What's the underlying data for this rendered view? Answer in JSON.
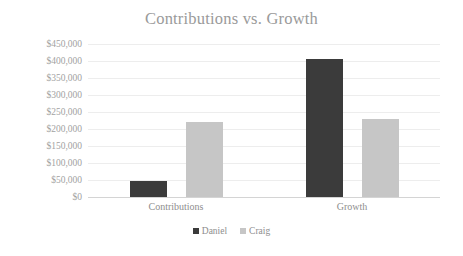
{
  "chart_data": {
    "type": "bar",
    "title": "Contributions vs. Growth",
    "xlabel": "",
    "ylabel": "",
    "categories": [
      "Contributions",
      "Growth"
    ],
    "series": [
      {
        "name": "Daniel",
        "color": "#3b3b3b",
        "values": [
          47000,
          405000
        ]
      },
      {
        "name": "Craig",
        "color": "#c6c6c6",
        "values": [
          220000,
          229000
        ]
      }
    ],
    "ylim": [
      0,
      450000
    ],
    "ytick_values": [
      0,
      50000,
      100000,
      150000,
      200000,
      250000,
      300000,
      350000,
      400000,
      450000
    ],
    "ytick_labels": [
      "$0",
      "$50,000",
      "$100,000",
      "$150,000",
      "$200,000",
      "$250,000",
      "$300,000",
      "$350,000",
      "$400,000",
      "$450,000"
    ],
    "grid": true,
    "grid_color": "#ededed",
    "legend_position": "bottom",
    "background": "#ffffff",
    "title_color": "#9a9a9a",
    "label_color": "#8e8e8e",
    "axis_line_color": "#d4d4d4"
  }
}
